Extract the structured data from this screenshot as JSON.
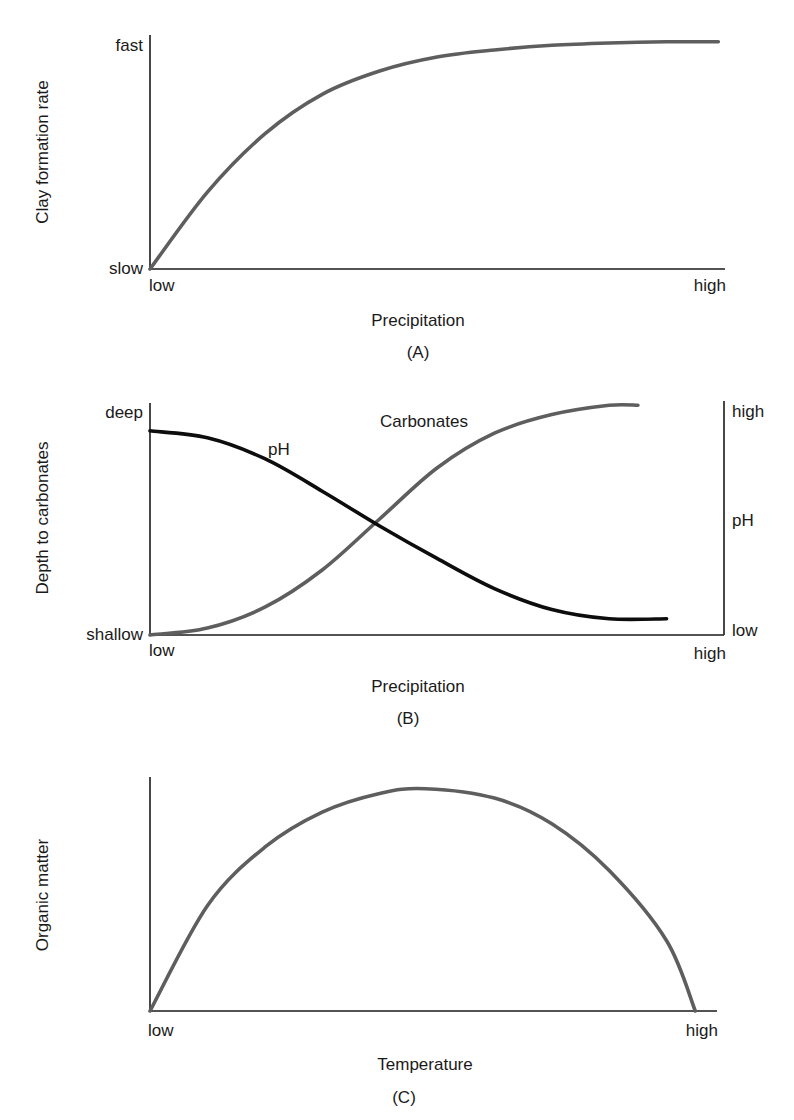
{
  "chart_data": [
    {
      "id": "A",
      "type": "line",
      "panel_label": "(A)",
      "xlabel": "Precipitation",
      "ylabel": "Clay formation rate",
      "x_tick_labels": [
        "low",
        "high"
      ],
      "y_tick_labels": [
        "slow",
        "fast"
      ],
      "xlim": [
        0,
        1
      ],
      "ylim": [
        0,
        1
      ],
      "grid": false,
      "series": [
        {
          "name": "Clay formation rate",
          "color": "#5e5e5e",
          "x": [
            0,
            0.1,
            0.2,
            0.3,
            0.4,
            0.5,
            0.6,
            0.7,
            0.8,
            0.9,
            0.99
          ],
          "y": [
            0,
            0.33,
            0.58,
            0.75,
            0.85,
            0.91,
            0.94,
            0.96,
            0.97,
            0.975,
            0.975
          ]
        }
      ]
    },
    {
      "id": "B",
      "type": "line",
      "panel_label": "(B)",
      "xlabel": "Precipitation",
      "ylabel": "Depth to carbonates",
      "ylabel_right": "pH",
      "x_tick_labels": [
        "low",
        "high"
      ],
      "y_tick_labels": [
        "shallow",
        "deep"
      ],
      "y_right_tick_labels": [
        "low",
        "high"
      ],
      "xlim": [
        0,
        1
      ],
      "ylim": [
        0,
        1
      ],
      "grid": false,
      "series": [
        {
          "name": "Carbonates",
          "label": "Carbonates",
          "color": "#5e5e5e",
          "x": [
            0,
            0.1,
            0.2,
            0.3,
            0.4,
            0.5,
            0.6,
            0.7,
            0.8,
            0.85
          ],
          "y": [
            0,
            0.03,
            0.12,
            0.28,
            0.5,
            0.72,
            0.87,
            0.95,
            0.99,
            0.99
          ]
        },
        {
          "name": "pH",
          "label": "pH",
          "color": "#0d0d0d",
          "x": [
            0,
            0.1,
            0.2,
            0.3,
            0.4,
            0.5,
            0.6,
            0.7,
            0.8,
            0.9
          ],
          "y": [
            0.88,
            0.85,
            0.76,
            0.62,
            0.47,
            0.33,
            0.2,
            0.11,
            0.07,
            0.07
          ]
        }
      ]
    },
    {
      "id": "C",
      "type": "line",
      "panel_label": "(C)",
      "xlabel": "Temperature",
      "ylabel": "Organic matter",
      "x_tick_labels": [
        "low",
        "high"
      ],
      "y_tick_labels": [],
      "xlim": [
        0,
        1
      ],
      "ylim": [
        0,
        1
      ],
      "grid": false,
      "series": [
        {
          "name": "Organic matter",
          "color": "#5e5e5e",
          "x": [
            0,
            0.1,
            0.2,
            0.3,
            0.4,
            0.48,
            0.6,
            0.7,
            0.8,
            0.9,
            0.95
          ],
          "y": [
            0,
            0.45,
            0.7,
            0.85,
            0.93,
            0.95,
            0.91,
            0.8,
            0.6,
            0.3,
            0
          ]
        }
      ]
    }
  ],
  "panels": {
    "A": {
      "ylabel": "Clay formation rate",
      "y_top": "fast",
      "y_bottom": "slow",
      "x_left": "low",
      "x_right": "high",
      "xlabel": "Precipitation",
      "caption": "(A)"
    },
    "B": {
      "ylabel": "Depth to carbonates",
      "y_top": "deep",
      "y_bottom": "shallow",
      "x_left": "low",
      "x_right": "high",
      "xlabel": "Precipitation",
      "caption": "(B)",
      "right_top": "high",
      "right_mid": "pH",
      "right_bottom": "low",
      "series_label_carbonates": "Carbonates",
      "series_label_ph": "pH"
    },
    "C": {
      "ylabel": "Organic matter",
      "x_left": "low",
      "x_right": "high",
      "xlabel": "Temperature",
      "caption": "(C)"
    }
  }
}
